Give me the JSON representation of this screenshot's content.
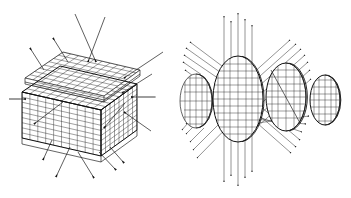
{
  "figure": {
    "background_color": "#ffffff",
    "line_color": "#111111",
    "mesh_color": "#2b2b2b",
    "accent_grey": "#8d8d8d",
    "width_px": 351,
    "height_px": 198,
    "panels": [
      {
        "id": "left-panel",
        "name": "meshed-cube-panel",
        "caption": "",
        "object": {
          "kind": "cube",
          "description": "Wireframe / finite-element meshed cube drawn in oblique projection with a thin slab layer on the top face",
          "mesh_divisions_u": 10,
          "mesh_divisions_v": 9,
          "mesh_divisions_top": 8
        },
        "arrows": [
          {
            "name": "arrow-top-left-outward-a",
            "direction": "up-left",
            "sense": "outgoing"
          },
          {
            "name": "arrow-top-left-outward-b",
            "direction": "up-left",
            "sense": "outgoing"
          },
          {
            "name": "arrow-top-incoming-a",
            "direction": "down-left",
            "sense": "incoming"
          },
          {
            "name": "arrow-top-incoming-b",
            "direction": "down-right",
            "sense": "incoming"
          },
          {
            "name": "arrow-top-right-incoming",
            "direction": "down-left",
            "sense": "incoming"
          },
          {
            "name": "arrow-right-upper-incoming",
            "direction": "down-left",
            "sense": "incoming"
          },
          {
            "name": "arrow-left-horizontal",
            "direction": "right",
            "sense": "incoming"
          },
          {
            "name": "arrow-right-horizontal",
            "direction": "left",
            "sense": "incoming"
          },
          {
            "name": "arrow-interior-left",
            "direction": "down-left",
            "sense": "internal"
          },
          {
            "name": "arrow-interior-right",
            "direction": "down-left",
            "sense": "internal"
          },
          {
            "name": "arrow-lower-right-incoming",
            "direction": "up-left",
            "sense": "incoming"
          },
          {
            "name": "arrow-bottom-left-outward",
            "direction": "down-left",
            "sense": "outgoing"
          },
          {
            "name": "arrow-bottom-mid-outward",
            "direction": "down-left",
            "sense": "outgoing"
          },
          {
            "name": "arrow-bottom-right-outward-a",
            "direction": "down-right",
            "sense": "outgoing"
          },
          {
            "name": "arrow-bottom-right-outward-b",
            "direction": "down-right",
            "sense": "outgoing"
          }
        ]
      },
      {
        "id": "right-panel",
        "name": "meshed-discs-panel",
        "caption": "",
        "discs": [
          {
            "name": "disc-1",
            "label": "",
            "size": "small",
            "position": "far-left"
          },
          {
            "name": "disc-2",
            "label": "",
            "size": "large",
            "position": "center-left"
          },
          {
            "name": "disc-3",
            "label": "",
            "size": "medium",
            "position": "center-right"
          },
          {
            "name": "disc-4",
            "label": "",
            "size": "small",
            "position": "far-right"
          }
        ],
        "ray_bundles": [
          {
            "name": "ray-bundle-vertical-up",
            "orientation": "vertical",
            "sense": "outgoing-up",
            "count": 5
          },
          {
            "name": "ray-bundle-vertical-down",
            "orientation": "vertical",
            "sense": "outgoing-down",
            "count": 5
          },
          {
            "name": "ray-bundle-diagonal-upper-left",
            "orientation": "diagonal-45",
            "sense": "outgoing",
            "count": 6
          },
          {
            "name": "ray-bundle-diagonal-upper-right",
            "orientation": "diagonal-45",
            "sense": "outgoing",
            "count": 7
          },
          {
            "name": "ray-bundle-diagonal-lower-left",
            "orientation": "diagonal-45",
            "sense": "outgoing",
            "count": 7
          },
          {
            "name": "ray-bundle-diagonal-lower-right",
            "orientation": "diagonal-45",
            "sense": "outgoing",
            "count": 6
          }
        ]
      }
    ]
  }
}
